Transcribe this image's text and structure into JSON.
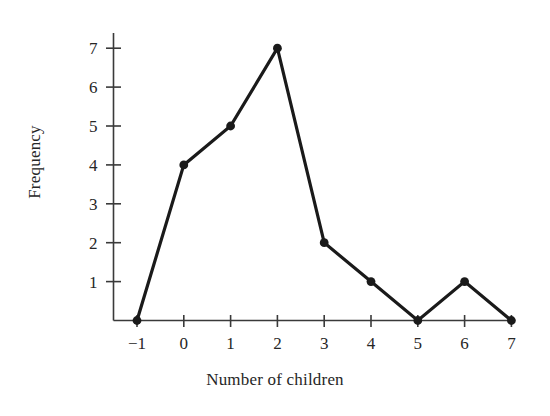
{
  "chart_data": {
    "type": "line",
    "title": "",
    "xlabel": "Number of children",
    "ylabel": "Frequency",
    "x": [
      -1,
      0,
      1,
      2,
      3,
      4,
      5,
      6,
      7
    ],
    "values": [
      0,
      4,
      5,
      7,
      2,
      1,
      0,
      1,
      0
    ],
    "series": [
      {
        "name": "Frequency",
        "values": [
          0,
          4,
          5,
          7,
          2,
          1,
          0,
          1,
          0
        ]
      }
    ],
    "x_tick_labels": [
      "−1",
      "0",
      "1",
      "2",
      "3",
      "4",
      "5",
      "6",
      "7"
    ],
    "y_tick_labels": [
      "1",
      "2",
      "3",
      "4",
      "5",
      "6",
      "7"
    ],
    "y_tick_values": [
      1,
      2,
      3,
      4,
      5,
      6,
      7
    ],
    "xlim": [
      -1,
      7
    ],
    "ylim": [
      0,
      7
    ],
    "grid": false,
    "legend": false,
    "legend_position": "none",
    "marker": "filled-circle",
    "line_color": "#1a1a1a",
    "marker_color": "#1a1a1a",
    "axis_color": "#3a3a3a",
    "background_color": "#ffffff"
  },
  "axes": {
    "x_axis_name": "x-axis",
    "y_axis_name": "y-axis"
  }
}
